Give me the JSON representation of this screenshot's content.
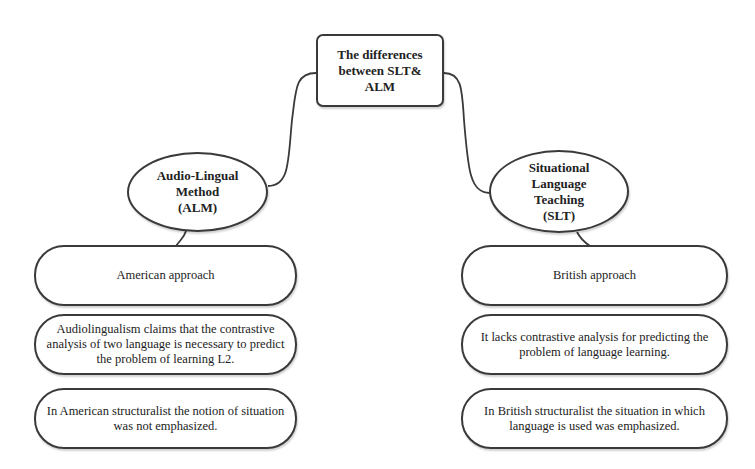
{
  "diagram": {
    "root": {
      "title": "The differences\nbetween SLT&\nALM"
    },
    "branches": [
      {
        "id": "alm",
        "title": "Audio-Lingual\nMethod\n(ALM)",
        "items": [
          "American approach",
          "Audiolingualism claims that the contrastive\nanalysis of two language is necessary to predict\nthe problem of learning L2.",
          "In American structuralist the notion of situation\nwas not emphasized."
        ]
      },
      {
        "id": "slt",
        "title": "Situational\nLanguage\nTeaching\n(SLT)",
        "items": [
          "British approach",
          "It lacks contrastive analysis for predicting the\nproblem of language learning.",
          "In British structuralist the situation in which\nlanguage is used was emphasized."
        ]
      }
    ],
    "colors": {
      "stroke": "#3a3a3a",
      "background": "#ffffff",
      "text": "#222222"
    }
  }
}
